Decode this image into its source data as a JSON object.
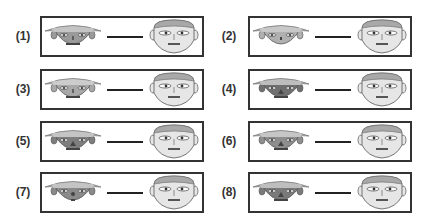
{
  "figure": {
    "line_color": "#222222",
    "border_color": "#333333",
    "right_face": {
      "skin": "#e6e6e6",
      "cap": "#a8a8a8"
    },
    "panels": [
      {
        "label": "(1)",
        "left_skin": "#9a9a9a",
        "left_hat": "#c4c4c4",
        "mouth": "line",
        "nose": "small"
      },
      {
        "label": "(2)",
        "left_skin": "#b0b0b0",
        "left_hat": "#c8c8c8",
        "mouth": "none",
        "nose": "dot"
      },
      {
        "label": "(3)",
        "left_skin": "#a8a8a8",
        "left_hat": "#cccccc",
        "mouth": "line",
        "nose": "small"
      },
      {
        "label": "(4)",
        "left_skin": "#6f6f6f",
        "left_hat": "#bdbdbd",
        "mouth": "line",
        "nose": "triangle"
      },
      {
        "label": "(5)",
        "left_skin": "#7e7e7e",
        "left_hat": "#c4c4c4",
        "mouth": "line",
        "nose": "triangle"
      },
      {
        "label": "(6)",
        "left_skin": "#8e8e8e",
        "left_hat": "#c6c6c6",
        "mouth": "line",
        "nose": "triangle"
      },
      {
        "label": "(7)",
        "left_skin": "#8a8a8a",
        "left_hat": "#c4c4c4",
        "mouth": "dot",
        "nose": "circle"
      },
      {
        "label": "(8)",
        "left_skin": "#7a7a7a",
        "left_hat": "#bebebe",
        "mouth": "line",
        "nose": "triangle"
      }
    ]
  }
}
